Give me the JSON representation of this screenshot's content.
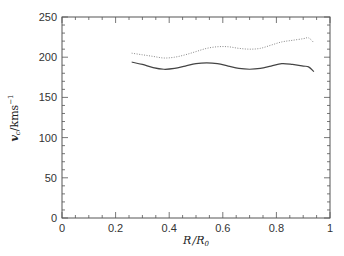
{
  "chart_data": {
    "type": "line",
    "title": "",
    "xlabel": "R/R_0",
    "xlabel_parts": {
      "main": "R",
      "sep": "/",
      "main2": "R",
      "sub": "0"
    },
    "ylabel": "v_c/kms^-1",
    "ylabel_parts": {
      "v": "v",
      "sub": "c",
      "unit": "/kms",
      "sup": "−1"
    },
    "xlim": [
      0,
      1
    ],
    "ylim": [
      0,
      250
    ],
    "x_ticks": [
      "0",
      "0.2",
      "0.4",
      "0.6",
      "0.8",
      "1"
    ],
    "x_tick_values": [
      0,
      0.2,
      0.4,
      0.6,
      0.8,
      1
    ],
    "y_ticks": [
      "0",
      "50",
      "100",
      "150",
      "200",
      "250"
    ],
    "y_tick_values": [
      0,
      50,
      100,
      150,
      200,
      250
    ],
    "grid": false,
    "legend": null,
    "series": [
      {
        "name": "solid",
        "style": "solid",
        "color": "#444444",
        "x": [
          0.26,
          0.3,
          0.34,
          0.38,
          0.42,
          0.46,
          0.5,
          0.54,
          0.58,
          0.62,
          0.66,
          0.7,
          0.74,
          0.78,
          0.82,
          0.86,
          0.9,
          0.92,
          0.94
        ],
        "y": [
          194,
          191,
          187,
          185,
          186,
          189,
          192,
          193,
          192,
          189,
          186,
          185,
          186,
          189,
          192,
          191,
          189,
          188,
          182
        ]
      },
      {
        "name": "dotted",
        "style": "dotted",
        "color": "#888888",
        "x": [
          0.26,
          0.3,
          0.34,
          0.38,
          0.42,
          0.46,
          0.5,
          0.54,
          0.58,
          0.62,
          0.66,
          0.7,
          0.74,
          0.78,
          0.82,
          0.86,
          0.9,
          0.92,
          0.94
        ],
        "y": [
          205,
          203,
          201,
          199,
          200,
          203,
          207,
          211,
          213,
          213,
          211,
          210,
          211,
          215,
          219,
          221,
          223,
          224,
          218
        ]
      }
    ]
  }
}
